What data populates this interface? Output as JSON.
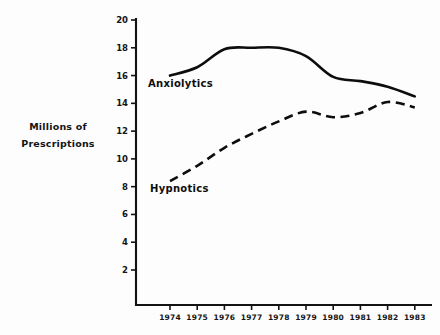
{
  "chart_data": {
    "type": "line",
    "title": "",
    "xlabel": "",
    "ylabel": "Millions of Prescriptions",
    "ylabel_lines": [
      "Millions of",
      "Prescriptions"
    ],
    "x": [
      1974,
      1975,
      1976,
      1977,
      1978,
      1979,
      1980,
      1981,
      1982,
      1983
    ],
    "xticklabels": [
      "1974",
      "1975",
      "1976",
      "1977",
      "1978",
      "1979",
      "1980",
      "1981",
      "1982",
      "1983"
    ],
    "yticks": [
      2,
      4,
      6,
      8,
      10,
      12,
      14,
      16,
      18,
      20
    ],
    "yticklabels": [
      "2",
      "4",
      "6",
      "8",
      "10",
      "12",
      "14",
      "16",
      "18",
      "20"
    ],
    "ylim": [
      0,
      20
    ],
    "xlim": [
      1973.5,
      1983.5
    ],
    "grid": false,
    "legend": "inline-annotations",
    "series": [
      {
        "name": "Anxiolytics",
        "style": "solid",
        "color": "#0d0d0d",
        "values": [
          16.0,
          16.6,
          17.9,
          18.0,
          18.0,
          17.4,
          15.9,
          15.6,
          15.2,
          14.5
        ]
      },
      {
        "name": "Hypnotics",
        "style": "dashed",
        "color": "#0d0d0d",
        "values": [
          8.4,
          9.5,
          10.8,
          11.8,
          12.7,
          13.4,
          13.0,
          13.3,
          14.1,
          13.7
        ]
      }
    ],
    "annotations": [
      {
        "text": "Anxiolytics",
        "x": 1975.1,
        "y": 15.2
      },
      {
        "text": "Hypnotics",
        "x": 1975.2,
        "y": 7.6
      }
    ]
  }
}
